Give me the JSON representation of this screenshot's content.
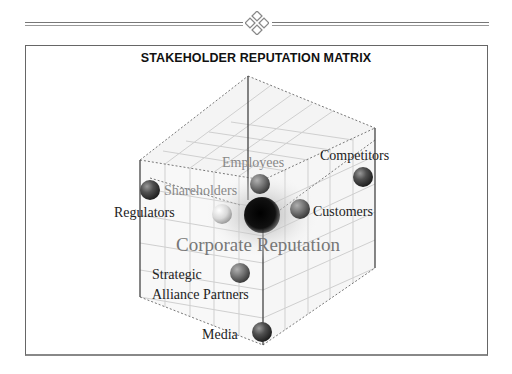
{
  "header": {
    "ornament_icon": "diamond-ornament-icon"
  },
  "diagram": {
    "title": "STAKEHOLDER REPUTATION MATRIX",
    "center_label": "Corporate Reputation",
    "stakeholders": [
      {
        "name": "Employees",
        "tone": "light",
        "sphere_color": "#7a7a7a"
      },
      {
        "name": "Competitors",
        "tone": "dark",
        "sphere_color": "#444444"
      },
      {
        "name": "Shareholders",
        "tone": "light",
        "sphere_color": "#d8d8d8"
      },
      {
        "name": "Regulators",
        "tone": "dark",
        "sphere_color": "#3e3e3e"
      },
      {
        "name": "Customers",
        "tone": "dark",
        "sphere_color": "#6e6e6e"
      },
      {
        "name": "Strategic",
        "tone": "dark",
        "sphere_color": "#5e5e5e"
      },
      {
        "name": "Alliance Partners",
        "tone": "dark",
        "sphere_color": "#5e5e5e"
      },
      {
        "name": "Media",
        "tone": "dark",
        "sphere_color": "#4a4a4a"
      }
    ],
    "center_sphere_color": "#111111"
  }
}
